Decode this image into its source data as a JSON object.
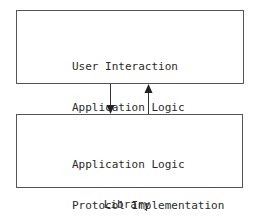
{
  "diagram": {
    "top_box": {
      "lines": [
        "User Interaction",
        "Application Logic"
      ]
    },
    "bottom_box": {
      "lines": [
        "Application Logic",
        "Protocol Implementation",
        "Socket Programming"
      ]
    },
    "arrows": [
      {
        "direction": "down",
        "from": "top_box",
        "to": "bottom_box"
      },
      {
        "direction": "up",
        "from": "bottom_box",
        "to": "top_box"
      }
    ],
    "caption": "Library",
    "colors": {
      "stroke": "#555555",
      "text": "#2a2a2a",
      "background": "#ffffff"
    }
  }
}
